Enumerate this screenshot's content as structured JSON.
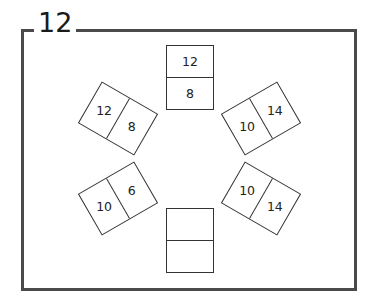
{
  "diagram": {
    "title": "12",
    "frame_color": "#4a4a4a",
    "cards": [
      {
        "id": "top",
        "top_value": "12",
        "bottom_value": "8",
        "cx": 190,
        "cy": 77,
        "rotation": 0
      },
      {
        "id": "upper-left",
        "top_value": "12",
        "bottom_value": "8",
        "cx": 118,
        "cy": 118,
        "rotation": -60
      },
      {
        "id": "upper-right",
        "top_value": "14",
        "bottom_value": "10",
        "cx": 261,
        "cy": 118,
        "rotation": 60
      },
      {
        "id": "lower-left",
        "top_value": "6",
        "bottom_value": "10",
        "cx": 118,
        "cy": 198,
        "rotation": 60
      },
      {
        "id": "lower-right",
        "top_value": "10",
        "bottom_value": "14",
        "cx": 261,
        "cy": 198,
        "rotation": -60
      },
      {
        "id": "bottom",
        "top_value": "",
        "bottom_value": "",
        "cx": 190,
        "cy": 240,
        "rotation": 0
      }
    ]
  }
}
